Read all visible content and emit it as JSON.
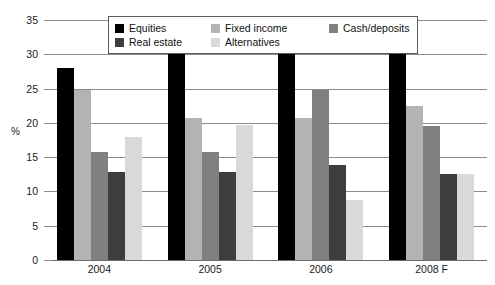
{
  "chart_data": {
    "type": "bar",
    "title": "",
    "xlabel": "",
    "ylabel": "%",
    "ylim": [
      0,
      35
    ],
    "yticks": [
      0,
      5,
      10,
      15,
      20,
      25,
      30,
      35
    ],
    "ytick_labels": [
      "0",
      "5",
      "10",
      "15",
      "20",
      "25",
      "30",
      "35"
    ],
    "grid": true,
    "legend_position": "top-center",
    "categories": [
      "2004",
      "2005",
      "2006",
      "2008 F"
    ],
    "series": [
      {
        "name": "Equities",
        "color": "#000000",
        "values": [
          28.0,
          30.6,
          30.7,
          30.6
        ]
      },
      {
        "name": "Fixed income",
        "color": "#b3b3b3",
        "values": [
          24.8,
          20.7,
          20.7,
          22.5
        ]
      },
      {
        "name": "Cash/deposits",
        "color": "#808080",
        "values": [
          15.8,
          15.7,
          24.8,
          19.6
        ]
      },
      {
        "name": "Real estate",
        "color": "#3d3d3d",
        "values": [
          12.8,
          12.8,
          13.8,
          12.6
        ]
      },
      {
        "name": "Alternatives",
        "color": "#d9d9d9",
        "values": [
          18.0,
          19.7,
          8.7,
          12.6
        ]
      }
    ]
  },
  "legend": {
    "rows": [
      [
        {
          "label": "Equities",
          "color": "#000000",
          "icon": "legend-swatch-equities"
        },
        {
          "label": "Fixed income",
          "color": "#b3b3b3",
          "icon": "legend-swatch-fixed-income"
        },
        {
          "label": "Cash/deposits",
          "color": "#808080",
          "icon": "legend-swatch-cash-deposits"
        }
      ],
      [
        {
          "label": "Real estate",
          "color": "#3d3d3d",
          "icon": "legend-swatch-real-estate"
        },
        {
          "label": "Alternatives",
          "color": "#d9d9d9",
          "icon": "legend-swatch-alternatives"
        }
      ]
    ]
  },
  "axis": {
    "y_title": "%"
  }
}
